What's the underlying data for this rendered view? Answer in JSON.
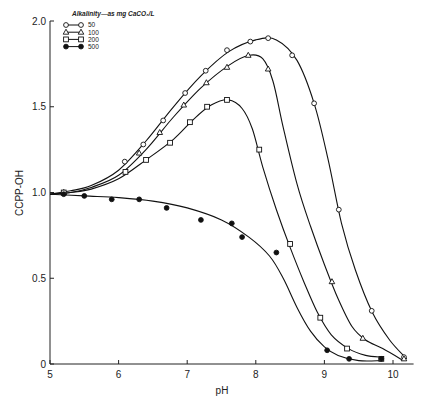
{
  "chart_data": {
    "type": "line",
    "title": "",
    "xlabel": "pH",
    "ylabel": "CCPP-OH",
    "xlim": [
      5,
      10.25
    ],
    "ylim": [
      0,
      2.0
    ],
    "xticks": [
      "5",
      "6",
      "7",
      "8",
      "9",
      "10"
    ],
    "yticks": [
      "0",
      "0.5",
      "1.0",
      "1.5",
      "2.0"
    ],
    "grid": false,
    "legend": {
      "title": "Alkalinity—as mg CaCO₃/L",
      "position": "upper-left",
      "entries": [
        "50",
        "100",
        "200",
        "500"
      ]
    },
    "series": [
      {
        "name": "50",
        "marker": "open-circle",
        "points": [
          [
            5.2,
            1.0
          ],
          [
            6.09,
            1.18
          ],
          [
            6.36,
            1.28
          ],
          [
            6.65,
            1.42
          ],
          [
            6.97,
            1.58
          ],
          [
            7.27,
            1.71
          ],
          [
            7.58,
            1.83
          ],
          [
            7.92,
            1.88
          ],
          [
            8.18,
            1.9
          ],
          [
            8.53,
            1.8
          ],
          [
            8.85,
            1.52
          ],
          [
            9.21,
            0.9
          ],
          [
            9.69,
            0.31
          ],
          [
            10.16,
            0.04
          ]
        ],
        "curve": [
          [
            5.0,
            0.99
          ],
          [
            5.3,
            1.01
          ],
          [
            5.6,
            1.04
          ],
          [
            6.0,
            1.13
          ],
          [
            6.4,
            1.3
          ],
          [
            6.8,
            1.5
          ],
          [
            7.2,
            1.68
          ],
          [
            7.6,
            1.82
          ],
          [
            8.0,
            1.89
          ],
          [
            8.3,
            1.89
          ],
          [
            8.6,
            1.77
          ],
          [
            8.85,
            1.52
          ],
          [
            9.05,
            1.2
          ],
          [
            9.25,
            0.82
          ],
          [
            9.45,
            0.55
          ],
          [
            9.7,
            0.3
          ],
          [
            9.95,
            0.14
          ],
          [
            10.2,
            0.03
          ]
        ]
      },
      {
        "name": "100",
        "marker": "open-triangle",
        "points": [
          [
            5.2,
            1.0
          ],
          [
            6.3,
            1.23
          ],
          [
            6.6,
            1.35
          ],
          [
            6.95,
            1.51
          ],
          [
            7.28,
            1.64
          ],
          [
            7.58,
            1.73
          ],
          [
            7.89,
            1.8
          ],
          [
            8.18,
            1.72
          ],
          [
            9.11,
            0.48
          ],
          [
            9.56,
            0.15
          ],
          [
            10.16,
            0.03
          ]
        ],
        "curve": [
          [
            5.0,
            0.99
          ],
          [
            5.3,
            1.0
          ],
          [
            5.6,
            1.03
          ],
          [
            6.0,
            1.1
          ],
          [
            6.4,
            1.25
          ],
          [
            6.8,
            1.44
          ],
          [
            7.2,
            1.61
          ],
          [
            7.6,
            1.74
          ],
          [
            7.9,
            1.8
          ],
          [
            8.1,
            1.78
          ],
          [
            8.25,
            1.65
          ],
          [
            8.4,
            1.38
          ],
          [
            8.6,
            1.05
          ],
          [
            8.8,
            0.8
          ],
          [
            9.0,
            0.58
          ],
          [
            9.2,
            0.38
          ],
          [
            9.4,
            0.22
          ],
          [
            9.6,
            0.14
          ],
          [
            9.85,
            0.09
          ],
          [
            10.15,
            0.02
          ]
        ]
      },
      {
        "name": "200",
        "marker": "open-square",
        "points": [
          [
            5.2,
            1.0
          ],
          [
            6.1,
            1.12
          ],
          [
            6.4,
            1.19
          ],
          [
            6.75,
            1.29
          ],
          [
            7.04,
            1.41
          ],
          [
            7.29,
            1.5
          ],
          [
            7.58,
            1.54
          ],
          [
            8.05,
            1.25
          ],
          [
            8.5,
            0.7
          ],
          [
            8.94,
            0.27
          ],
          [
            9.33,
            0.09
          ],
          [
            9.83,
            0.03
          ]
        ],
        "curve": [
          [
            5.0,
            0.99
          ],
          [
            5.3,
            1.0
          ],
          [
            5.6,
            1.02
          ],
          [
            6.0,
            1.08
          ],
          [
            6.4,
            1.19
          ],
          [
            6.8,
            1.31
          ],
          [
            7.1,
            1.43
          ],
          [
            7.35,
            1.51
          ],
          [
            7.6,
            1.54
          ],
          [
            7.8,
            1.49
          ],
          [
            7.95,
            1.37
          ],
          [
            8.1,
            1.15
          ],
          [
            8.3,
            0.9
          ],
          [
            8.5,
            0.68
          ],
          [
            8.7,
            0.48
          ],
          [
            8.9,
            0.3
          ],
          [
            9.1,
            0.17
          ],
          [
            9.35,
            0.09
          ],
          [
            9.6,
            0.05
          ],
          [
            9.83,
            0.04
          ]
        ]
      },
      {
        "name": "500",
        "marker": "filled-circle",
        "points": [
          [
            5.2,
            0.99
          ],
          [
            5.5,
            0.98
          ],
          [
            5.9,
            0.96
          ],
          [
            6.3,
            0.96
          ],
          [
            6.7,
            0.91
          ],
          [
            7.2,
            0.84
          ],
          [
            7.65,
            0.82
          ],
          [
            7.8,
            0.74
          ],
          [
            8.3,
            0.65
          ],
          [
            9.04,
            0.08
          ],
          [
            9.36,
            0.03
          ],
          [
            9.83,
            0.03
          ]
        ],
        "curve": [
          [
            5.0,
            0.99
          ],
          [
            5.5,
            0.98
          ],
          [
            6.0,
            0.97
          ],
          [
            6.5,
            0.95
          ],
          [
            7.0,
            0.91
          ],
          [
            7.5,
            0.84
          ],
          [
            7.9,
            0.74
          ],
          [
            8.2,
            0.63
          ],
          [
            8.4,
            0.5
          ],
          [
            8.6,
            0.33
          ],
          [
            8.8,
            0.19
          ],
          [
            9.0,
            0.1
          ],
          [
            9.2,
            0.05
          ],
          [
            9.5,
            0.02
          ],
          [
            9.83,
            0.02
          ]
        ]
      }
    ]
  }
}
